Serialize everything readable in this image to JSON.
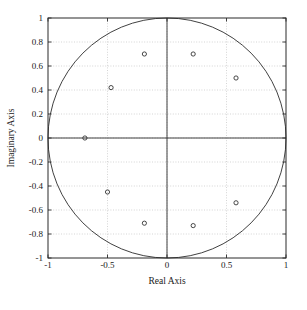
{
  "chart_data": {
    "type": "scatter",
    "title": "",
    "xlabel": "Real Axis",
    "ylabel": "Imaginary Axis",
    "xlim": [
      -1,
      1
    ],
    "ylim": [
      -1,
      1
    ],
    "grid": true,
    "grid_style": "dotted",
    "legend": null,
    "xticks": [
      -1,
      -0.5,
      0,
      0.5,
      1
    ],
    "xticklabels": [
      "-1",
      "-0.5",
      "0",
      "0.5",
      "1"
    ],
    "yticks": [
      -1,
      -0.8,
      -0.6,
      -0.4,
      -0.2,
      0,
      0.2,
      0.4,
      0.6,
      0.8,
      1
    ],
    "yticklabels": [
      "-1",
      "-0.8",
      "-0.6",
      "-0.4",
      "-0.2",
      "0",
      "0.2",
      "0.4",
      "0.6",
      "0.8",
      "1"
    ],
    "annotations": [
      {
        "name": "unit-circle",
        "type": "circle",
        "cx": 0,
        "cy": 0,
        "r": 1
      },
      {
        "name": "real-axis-line",
        "type": "hline",
        "y": 0
      },
      {
        "name": "imaginary-axis-line",
        "type": "vline",
        "x": 0
      }
    ],
    "series": [
      {
        "name": "poles",
        "marker": "circle-open",
        "color": "#333333",
        "points": [
          {
            "x": -0.19,
            "y": 0.7
          },
          {
            "x": 0.22,
            "y": 0.7
          },
          {
            "x": 0.58,
            "y": 0.5
          },
          {
            "x": -0.47,
            "y": 0.42
          },
          {
            "x": -0.69,
            "y": 0.0
          },
          {
            "x": -0.5,
            "y": -0.45
          },
          {
            "x": 0.58,
            "y": -0.54
          },
          {
            "x": -0.19,
            "y": -0.71
          },
          {
            "x": 0.22,
            "y": -0.73
          }
        ]
      }
    ]
  },
  "colors": {
    "axis": "#2b2b2b",
    "grid": "#b9b9b9",
    "marker": "#333333",
    "background": "#ffffff",
    "caption": "#9a9a9a"
  },
  "caption": {
    "line": "  "
  }
}
